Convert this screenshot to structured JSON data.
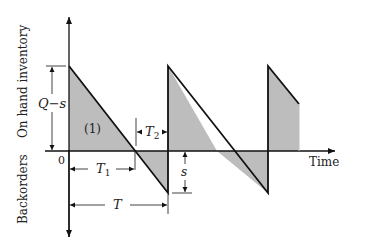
{
  "diagram": {
    "type": "inventory-sawtooth-with-backorders",
    "axes": {
      "y_upper_label": "On hand inventory",
      "y_lower_label": "Backorders",
      "x_label": "Time",
      "origin_label": "0"
    },
    "annotations": {
      "q_minus_s": "Q−s",
      "region_1": "(1)",
      "t1": "T",
      "t1_sub": "1",
      "t2": "T",
      "t2_sub": "2",
      "t": "T",
      "s": "s"
    },
    "colors": {
      "fill": "#bdbdbd",
      "line": "#111111",
      "background": "#ffffff"
    }
  }
}
